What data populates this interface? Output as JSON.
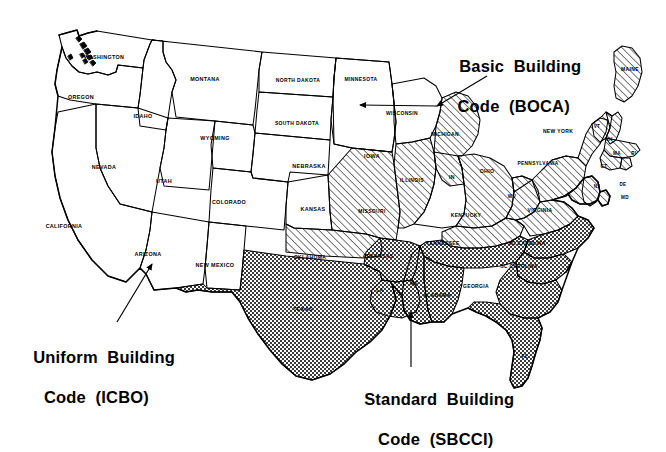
{
  "figure": {
    "kind": "us-map-building-codes",
    "background": "#ffffff",
    "outline_color": "#000000",
    "text_color": "#000000"
  },
  "callouts": [
    {
      "id": "boca",
      "line1": "Basic  Building",
      "line2": "Code  (BOCA)",
      "region": "hatch",
      "x": 440,
      "y": 36
    },
    {
      "id": "icbo",
      "line1": "Uniform  Building",
      "line2": "Code  (ICBO)",
      "region": "plain",
      "x": 14,
      "y": 327
    },
    {
      "id": "sbcci",
      "line1": "Standard  Building",
      "line2": "Code  (SBCCI)",
      "region": "crosshatch",
      "x": 345,
      "y": 369
    }
  ],
  "leaders": [
    {
      "id": "leader-boca-michigan",
      "from": [
        487,
        76
      ],
      "to": [
        437,
        106
      ]
    },
    {
      "id": "leader-boca-uppermich",
      "from": [
        437,
        106
      ],
      "to": [
        360,
        105
      ]
    },
    {
      "id": "leader-icbo-arizona",
      "from": [
        117,
        322
      ],
      "to": [
        152,
        264
      ]
    },
    {
      "id": "leader-sbcci-alabama",
      "from": [
        411,
        367
      ],
      "to": [
        411,
        312
      ]
    }
  ],
  "regions": {
    "plain": {
      "name": "Uniform Building Code (ICBO)",
      "fill": "#ffffff",
      "pattern": "none"
    },
    "hatch": {
      "name": "Basic Building Code (BOCA)",
      "fill": "#ffffff",
      "pattern": "diagonal-hatch"
    },
    "crosshatch": {
      "name": "Standard Building Code (SBCCI)",
      "fill": "#ffffff",
      "pattern": "checker-crosshatch"
    }
  },
  "states": [
    {
      "code": "WA",
      "label": "WASHINGTON",
      "region": "plain",
      "lx": 104,
      "ly": 59,
      "fs": 5.4
    },
    {
      "code": "OR",
      "label": "OREGON",
      "region": "plain",
      "lx": 81,
      "ly": 99,
      "fs": 5.4
    },
    {
      "code": "ID",
      "label": "IDAHO",
      "region": "plain",
      "lx": 143,
      "ly": 118,
      "fs": 5.4
    },
    {
      "code": "MT",
      "label": "MONTANA",
      "region": "plain",
      "lx": 205,
      "ly": 81,
      "fs": 5.4
    },
    {
      "code": "ND",
      "label": "NORTH DAKOTA",
      "region": "plain",
      "lx": 298,
      "ly": 82,
      "fs": 5.0
    },
    {
      "code": "MN",
      "label": "MINNESOTA",
      "region": "plain",
      "lx": 361,
      "ly": 81,
      "fs": 5.0
    },
    {
      "code": "SD",
      "label": "SOUTH DAKOTA",
      "region": "plain",
      "lx": 297,
      "ly": 125,
      "fs": 5.0
    },
    {
      "code": "WY",
      "label": "WYOMING",
      "region": "plain",
      "lx": 215,
      "ly": 140,
      "fs": 5.4
    },
    {
      "code": "NV",
      "label": "NEVADA",
      "region": "plain",
      "lx": 104,
      "ly": 169,
      "fs": 5.4
    },
    {
      "code": "UT",
      "label": "UTAH",
      "region": "plain",
      "lx": 164,
      "ly": 183,
      "fs": 5.4
    },
    {
      "code": "CO",
      "label": "COLORADO",
      "region": "plain",
      "lx": 229,
      "ly": 204,
      "fs": 5.4
    },
    {
      "code": "NE",
      "label": "NEBRASKA",
      "region": "plain",
      "lx": 309,
      "ly": 168,
      "fs": 5.4
    },
    {
      "code": "IA",
      "label": "IOWA",
      "region": "plain",
      "lx": 372,
      "ly": 158,
      "fs": 5.4
    },
    {
      "code": "WI",
      "label": "WISCONSIN",
      "region": "plain",
      "lx": 402,
      "ly": 115,
      "fs": 5.0
    },
    {
      "code": "KS",
      "label": "KANSAS",
      "region": "plain",
      "lx": 313,
      "ly": 211,
      "fs": 5.4
    },
    {
      "code": "CA",
      "label": "CALIFORNIA",
      "region": "plain",
      "lx": 64,
      "ly": 228,
      "fs": 5.4
    },
    {
      "code": "AZ",
      "label": "ARIZONA",
      "region": "plain",
      "lx": 148,
      "ly": 256,
      "fs": 5.4
    },
    {
      "code": "NM",
      "label": "NEW MEXICO",
      "region": "plain",
      "lx": 215,
      "ly": 267,
      "fs": 5.4
    },
    {
      "code": "IN",
      "label": "IN",
      "region": "plain",
      "lx": 452,
      "ly": 179,
      "fs": 5.2
    },
    {
      "code": "MI",
      "label": "MICHIGAN",
      "region": "hatch",
      "lx": 445,
      "ly": 136,
      "fs": 5.0
    },
    {
      "code": "IL",
      "label": "ILLINOIS",
      "region": "hatch",
      "lx": 412,
      "ly": 182,
      "fs": 5.0
    },
    {
      "code": "MO",
      "label": "MISSOURI",
      "region": "hatch",
      "lx": 372,
      "ly": 213,
      "fs": 5.0
    },
    {
      "code": "OH",
      "label": "OHIO",
      "region": "hatch",
      "lx": 487,
      "ly": 173,
      "fs": 5.2
    },
    {
      "code": "OK",
      "label": "OKLAHOMA",
      "region": "hatch",
      "lx": 310,
      "ly": 259,
      "fs": 5.0
    },
    {
      "code": "KY",
      "label": "KENTUCKY",
      "region": "hatch",
      "lx": 466,
      "ly": 217,
      "fs": 5.0
    },
    {
      "code": "WV",
      "label": "WV",
      "region": "hatch",
      "lx": 512,
      "ly": 198,
      "fs": 4.8
    },
    {
      "code": "VA",
      "label": "VIRGINIA",
      "region": "hatch",
      "lx": 540,
      "ly": 212,
      "fs": 5.0
    },
    {
      "code": "PA",
      "label": "PENNSYLVANIA",
      "region": "hatch",
      "lx": 538,
      "ly": 165,
      "fs": 4.8
    },
    {
      "code": "NY",
      "label": "NEW YORK",
      "region": "hatch",
      "lx": 558,
      "ly": 133,
      "fs": 5.0
    },
    {
      "code": "ME",
      "label": "MAINE",
      "region": "hatch",
      "lx": 630,
      "ly": 71,
      "fs": 5.0
    },
    {
      "code": "VT",
      "label": "VT",
      "region": "hatch",
      "lx": 597,
      "ly": 128,
      "fs": 4.6
    },
    {
      "code": "NH",
      "label": "NH",
      "region": "hatch",
      "lx": 609,
      "ly": 141,
      "fs": 4.6
    },
    {
      "code": "MA",
      "label": "MA",
      "region": "hatch",
      "lx": 617,
      "ly": 155,
      "fs": 4.6
    },
    {
      "code": "CT",
      "label": "CT",
      "region": "hatch",
      "lx": 604,
      "ly": 168,
      "fs": 4.6
    },
    {
      "code": "RI",
      "label": "RI",
      "region": "hatch",
      "lx": 634,
      "ly": 155,
      "fs": 4.6
    },
    {
      "code": "NJ",
      "label": "NJ",
      "region": "hatch",
      "lx": 597,
      "ly": 188,
      "fs": 4.6
    },
    {
      "code": "DE",
      "label": "DE",
      "region": "hatch",
      "lx": 623,
      "ly": 186,
      "fs": 4.6
    },
    {
      "code": "MD",
      "label": "MD",
      "region": "hatch",
      "lx": 625,
      "ly": 199,
      "fs": 4.6
    },
    {
      "code": "TX",
      "label": "TEXAS",
      "region": "crosshatch",
      "lx": 303,
      "ly": 311,
      "fs": 5.4
    },
    {
      "code": "AR",
      "label": "ARKANSAS",
      "region": "crosshatch",
      "lx": 378,
      "ly": 258,
      "fs": 5.0
    },
    {
      "code": "LA",
      "label": "LA",
      "region": "crosshatch",
      "lx": 380,
      "ly": 292,
      "fs": 5.0
    },
    {
      "code": "MS",
      "label": "MS",
      "region": "crosshatch",
      "lx": 414,
      "ly": 285,
      "fs": 5.0
    },
    {
      "code": "AL",
      "label": "ALABAMA",
      "region": "crosshatch",
      "lx": 437,
      "ly": 297,
      "fs": 5.0
    },
    {
      "code": "TN",
      "label": "TENNESSEE",
      "region": "crosshatch",
      "lx": 443,
      "ly": 245,
      "fs": 5.0
    },
    {
      "code": "GA",
      "label": "GEORGIA",
      "region": "crosshatch",
      "lx": 476,
      "ly": 288,
      "fs": 5.0
    },
    {
      "code": "FL",
      "label": "FL",
      "region": "crosshatch",
      "lx": 525,
      "ly": 358,
      "fs": 5.0
    },
    {
      "code": "SC",
      "label": "SC CAROLINA",
      "region": "crosshatch",
      "lx": 519,
      "ly": 268,
      "fs": 4.8
    },
    {
      "code": "NC",
      "label": "NC CAROLINA",
      "region": "crosshatch",
      "lx": 527,
      "ly": 245,
      "fs": 4.8
    }
  ]
}
